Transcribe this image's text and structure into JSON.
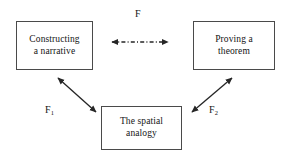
{
  "diagram": {
    "background_color": "#ffffff",
    "line_color": "#262626",
    "box_border_color": "#4a4a4a",
    "text_color": "#141414",
    "nodes": [
      {
        "id": "constructing",
        "label": "Constructing\na narrative",
        "x": 16,
        "y": 21,
        "width": 77,
        "height": 49
      },
      {
        "id": "proving",
        "label": "Proving a\ntheorem",
        "x": 193,
        "y": 21,
        "width": 82,
        "height": 49
      },
      {
        "id": "analogy",
        "label": "The spatial\nanalogy",
        "x": 101,
        "y": 106,
        "width": 81,
        "height": 44
      }
    ],
    "edges": [
      {
        "id": "edge-f",
        "label": "F",
        "from": "constructing",
        "to": "proving",
        "style": "dashdot",
        "arrows": "both"
      },
      {
        "id": "edge-f1",
        "label": "F",
        "label_subscript": "1",
        "from": "constructing",
        "to": "analogy",
        "style": "solid",
        "arrows": "both"
      },
      {
        "id": "edge-f2",
        "label": "F",
        "label_subscript": "2",
        "from": "analogy",
        "to": "proving",
        "style": "solid",
        "arrows": "both"
      }
    ]
  }
}
